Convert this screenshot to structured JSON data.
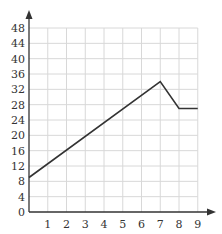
{
  "chart_data": {
    "type": "line",
    "title": "",
    "xlabel": "",
    "ylabel": "",
    "x": [
      0,
      7,
      8,
      9
    ],
    "series": [
      {
        "name": "line",
        "values": [
          9,
          34,
          27,
          27
        ]
      }
    ],
    "x_ticks": [
      1,
      2,
      3,
      4,
      5,
      6,
      7,
      8,
      9
    ],
    "y_ticks": [
      0,
      4,
      8,
      12,
      16,
      20,
      24,
      28,
      32,
      36,
      40,
      44,
      48
    ],
    "xlim": [
      0,
      9
    ],
    "ylim": [
      0,
      48
    ],
    "grid": true,
    "legend": null,
    "colors": {
      "line": "#333333",
      "grid": "#d8d8d8",
      "axis": "#333333"
    }
  }
}
